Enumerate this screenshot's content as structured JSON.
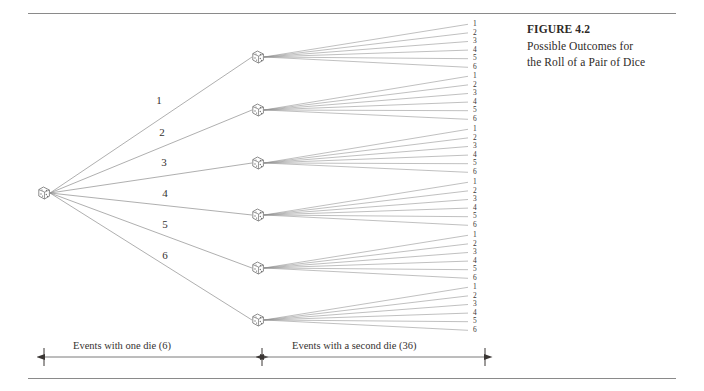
{
  "figure": {
    "caption_title": "FIGURE 4.2",
    "caption_line1": "Possible Outcomes for",
    "caption_line2": "the Roll of a Pair of Dice"
  },
  "diagram": {
    "type": "tree",
    "root": {
      "icon": "die-icon",
      "x": 44,
      "y": 193
    },
    "first_level_labels": [
      "1",
      "2",
      "3",
      "4",
      "5",
      "6"
    ],
    "first_level_label_positions": [
      {
        "x": 159,
        "y": 101
      },
      {
        "x": 162,
        "y": 133
      },
      {
        "x": 164,
        "y": 163
      },
      {
        "x": 165,
        "y": 194
      },
      {
        "x": 165,
        "y": 225
      },
      {
        "x": 165,
        "y": 256
      }
    ],
    "second_level_nodes": [
      {
        "icon": "die-icon",
        "x": 258,
        "y": 57
      },
      {
        "icon": "die-icon",
        "x": 258,
        "y": 110
      },
      {
        "icon": "die-icon",
        "x": 258,
        "y": 163
      },
      {
        "icon": "die-icon",
        "x": 258,
        "y": 215
      },
      {
        "icon": "die-icon",
        "x": 258,
        "y": 268
      },
      {
        "icon": "die-icon",
        "x": 258,
        "y": 320
      }
    ],
    "outcome_labels": [
      "1",
      "2",
      "3",
      "4",
      "5",
      "6"
    ],
    "outcome_group_tops": [
      20,
      72,
      125,
      178,
      231,
      283
    ],
    "outcome_x": 473,
    "leaf_x": 468
  },
  "axis": {
    "left_label": "Events with one die (6)",
    "right_label": "Events with a second die (36)",
    "left_start_x": 44,
    "left_end_x": 260,
    "right_start_x": 264,
    "right_end_x": 485,
    "y": 357
  },
  "colors": {
    "rule": "#8a8a8a",
    "line": "#8c8c8c",
    "text": "#2e2a28",
    "die_stroke": "#6e6e6e",
    "background": "#ffffff"
  }
}
